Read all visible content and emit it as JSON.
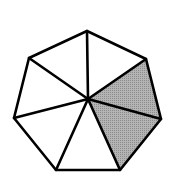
{
  "diagram": {
    "shape": "heptagon",
    "divisions": 7,
    "shaded_count": 2,
    "vertices": [
      [
        87,
        31
      ],
      [
        146,
        59
      ],
      [
        161,
        119
      ],
      [
        120,
        170
      ],
      [
        56,
        170
      ],
      [
        14,
        118
      ],
      [
        29,
        58
      ]
    ],
    "center": [
      88,
      99
    ],
    "shaded_sectors": [
      1,
      2
    ],
    "colors": {
      "stroke": "#000000",
      "fill": "#ffffff",
      "shade": "#a8a8a8"
    },
    "stroke_width": 2.6
  }
}
